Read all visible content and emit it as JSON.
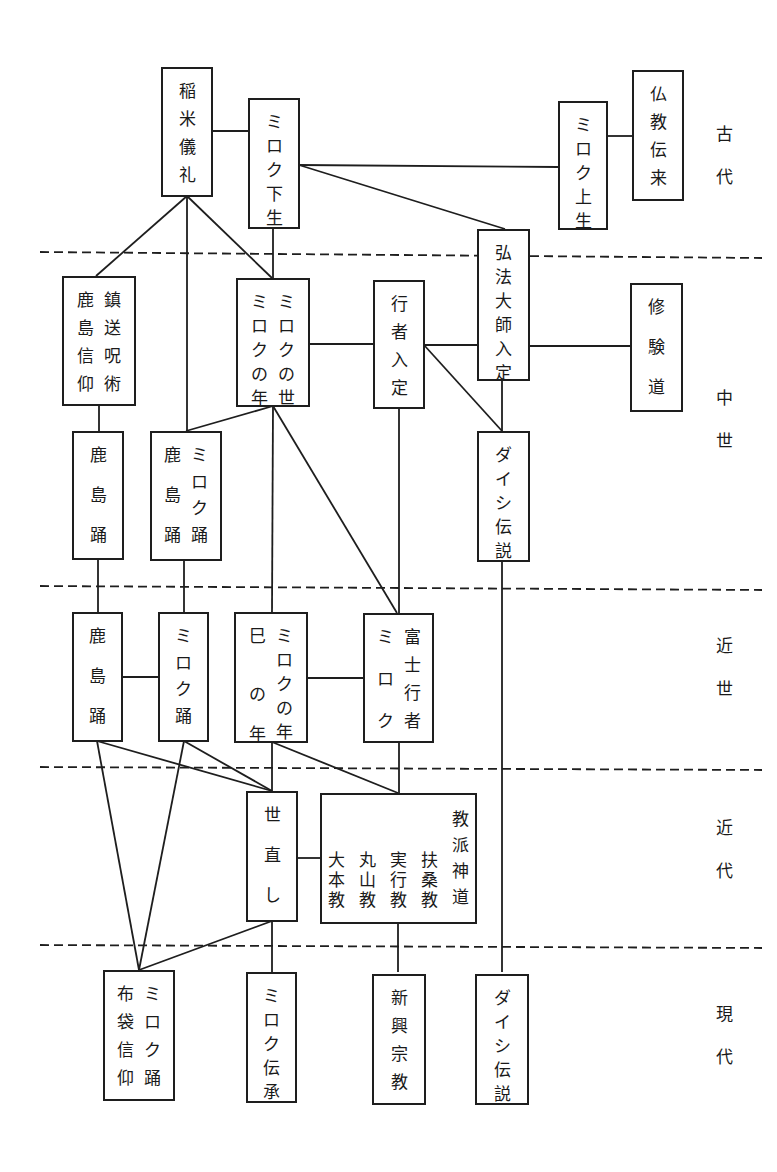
{
  "diagram": {
    "type": "genealogy-flowchart",
    "orientation": "vertical-japanese-text",
    "eras": [
      {
        "id": "kodai",
        "label": "古代",
        "chars": [
          "古",
          "代"
        ]
      },
      {
        "id": "chusei",
        "label": "中世",
        "chars": [
          "中",
          "世"
        ]
      },
      {
        "id": "kinsei",
        "label": "近世",
        "chars": [
          "近",
          "世"
        ]
      },
      {
        "id": "kindai",
        "label": "近代",
        "chars": [
          "近",
          "代"
        ]
      },
      {
        "id": "gendai",
        "label": "現代",
        "chars": [
          "現",
          "代"
        ]
      }
    ],
    "nodes": [
      {
        "id": "inamai",
        "era": "kodai",
        "columns": [
          [
            "稲",
            "米",
            "儀",
            "礼"
          ]
        ],
        "label": "稲米儀礼"
      },
      {
        "id": "miroku_gesho",
        "era": "kodai",
        "columns": [
          [
            "ミ",
            "ロ",
            "ク",
            "下",
            "生"
          ]
        ],
        "label": "ミロク下生"
      },
      {
        "id": "miroku_josho",
        "era": "kodai",
        "columns": [
          [
            "ミ",
            "ロ",
            "ク",
            "上",
            "生"
          ]
        ],
        "label": "ミロク上生"
      },
      {
        "id": "bukkyo_denrai",
        "era": "kodai",
        "columns": [
          [
            "仏",
            "教",
            "伝",
            "来"
          ]
        ],
        "label": "仏教伝来"
      },
      {
        "id": "kashima_chinso",
        "era": "chusei",
        "columns": [
          [
            "鎮",
            "送",
            "呪",
            "術"
          ],
          [
            "鹿",
            "島",
            "信",
            "仰"
          ]
        ],
        "label": "鎮送呪術 / 鹿島信仰"
      },
      {
        "id": "miroku_yo_toshi",
        "era": "chusei",
        "columns": [
          [
            "ミ",
            "ロ",
            "ク",
            "の",
            "世"
          ],
          [
            "ミ",
            "ロ",
            "ク",
            "の",
            "年"
          ]
        ],
        "label": "ミロクの世 / ミロクの年"
      },
      {
        "id": "gyoja_nyujo",
        "era": "chusei",
        "columns": [
          [
            "行",
            "者",
            "入",
            "定"
          ]
        ],
        "label": "行者入定"
      },
      {
        "id": "kobo_nyujo",
        "era": "chusei",
        "columns": [
          [
            "弘",
            "法",
            "大",
            "師",
            "入",
            "定"
          ]
        ],
        "label": "弘法大師入定"
      },
      {
        "id": "shugendo",
        "era": "chusei",
        "columns": [
          [
            "修",
            "験",
            "道"
          ]
        ],
        "label": "修験道"
      },
      {
        "id": "kashima_odori_1",
        "era": "chusei",
        "columns": [
          [
            "鹿",
            "島",
            "踊"
          ]
        ],
        "label": "鹿島踊"
      },
      {
        "id": "kashima_miroku_odori",
        "era": "chusei",
        "columns": [
          [
            "ミ",
            "ロ",
            "ク",
            "踊"
          ],
          [
            "鹿",
            "島",
            "踊"
          ]
        ],
        "label": "ミロク踊 / 鹿島踊"
      },
      {
        "id": "daishi_1",
        "era": "chusei",
        "columns": [
          [
            "ダ",
            "イ",
            "シ",
            "伝",
            "説"
          ]
        ],
        "label": "ダイシ伝説"
      },
      {
        "id": "kashima_odori_2",
        "era": "kinsei",
        "columns": [
          [
            "鹿",
            "島",
            "踊"
          ]
        ],
        "label": "鹿島踊"
      },
      {
        "id": "miroku_odori",
        "era": "kinsei",
        "columns": [
          [
            "ミ",
            "ロ",
            "ク",
            "踊"
          ]
        ],
        "label": "ミロク踊"
      },
      {
        "id": "mi_no_toshi",
        "era": "kinsei",
        "columns": [
          [
            "ミ",
            "ロ",
            "ク",
            "の",
            "年"
          ],
          [
            "巳",
            "の",
            "年"
          ]
        ],
        "label": "ミロクの年 / 巳の年"
      },
      {
        "id": "fuji_gyoja",
        "era": "kinsei",
        "columns": [
          [
            "富",
            "士",
            "行",
            "者"
          ],
          [
            "ミ",
            "ロ",
            "ク"
          ]
        ],
        "label": "富士行者 / ミロク"
      },
      {
        "id": "yonaoshi",
        "era": "kindai",
        "columns": [
          [
            "世",
            "直",
            "し"
          ]
        ],
        "label": "世直し"
      },
      {
        "id": "kyoha_shinto",
        "era": "kindai",
        "columns": [
          [
            "教",
            "派",
            "神",
            "道"
          ],
          [
            "扶",
            "桑",
            "教"
          ],
          [
            "実",
            "行",
            "教"
          ],
          [
            "丸",
            "山",
            "教"
          ],
          [
            "大",
            "本",
            "教"
          ]
        ],
        "label": "教派神道 扶桑教 実行教 丸山教 大本教"
      },
      {
        "id": "hotei_miroku_odori",
        "era": "gendai",
        "columns": [
          [
            "ミ",
            "ロ",
            "ク",
            "踊"
          ],
          [
            "布",
            "袋",
            "信",
            "仰"
          ]
        ],
        "label": "ミロク踊 / 布袋信仰"
      },
      {
        "id": "miroku_densho",
        "era": "gendai",
        "columns": [
          [
            "ミ",
            "ロ",
            "ク",
            "伝",
            "承"
          ]
        ],
        "label": "ミロク伝承"
      },
      {
        "id": "shinko_shukyo",
        "era": "gendai",
        "columns": [
          [
            "新",
            "興",
            "宗",
            "教"
          ]
        ],
        "label": "新興宗教"
      },
      {
        "id": "daishi_2",
        "era": "gendai",
        "columns": [
          [
            "ダ",
            "イ",
            "シ",
            "伝",
            "説"
          ]
        ],
        "label": "ダイシ伝説"
      }
    ],
    "edges": [
      [
        "inamai",
        "miroku_gesho"
      ],
      [
        "inamai",
        "kashima_chinso"
      ],
      [
        "inamai",
        "kashima_miroku_odori"
      ],
      [
        "inamai",
        "miroku_yo_toshi"
      ],
      [
        "miroku_gesho",
        "miroku_josho"
      ],
      [
        "miroku_gesho",
        "kobo_nyujo"
      ],
      [
        "miroku_gesho",
        "miroku_yo_toshi"
      ],
      [
        "miroku_josho",
        "bukkyo_denrai"
      ],
      [
        "miroku_yo_toshi",
        "gyoja_nyujo"
      ],
      [
        "gyoja_nyujo",
        "kobo_nyujo"
      ],
      [
        "gyoja_nyujo",
        "daishi_1"
      ],
      [
        "kobo_nyujo",
        "shugendo"
      ],
      [
        "kobo_nyujo",
        "daishi_1"
      ],
      [
        "kashima_chinso",
        "kashima_odori_1"
      ],
      [
        "miroku_yo_toshi",
        "kashima_miroku_odori"
      ],
      [
        "miroku_yo_toshi",
        "mi_no_toshi"
      ],
      [
        "miroku_yo_toshi",
        "fuji_gyoja"
      ],
      [
        "gyoja_nyujo",
        "fuji_gyoja"
      ],
      [
        "kashima_odori_1",
        "kashima_odori_2"
      ],
      [
        "kashima_miroku_odori",
        "miroku_odori"
      ],
      [
        "daishi_1",
        "daishi_2"
      ],
      [
        "kashima_odori_2",
        "miroku_odori"
      ],
      [
        "mi_no_toshi",
        "fuji_gyoja"
      ],
      [
        "kashima_odori_2",
        "yonaoshi"
      ],
      [
        "kashima_odori_2",
        "hotei_miroku_odori"
      ],
      [
        "miroku_odori",
        "yonaoshi"
      ],
      [
        "miroku_odori",
        "hotei_miroku_odori"
      ],
      [
        "mi_no_toshi",
        "yonaoshi"
      ],
      [
        "mi_no_toshi",
        "kyoha_shinto"
      ],
      [
        "fuji_gyoja",
        "kyoha_shinto"
      ],
      [
        "yonaoshi",
        "kyoha_shinto"
      ],
      [
        "yonaoshi",
        "hotei_miroku_odori"
      ],
      [
        "yonaoshi",
        "miroku_densho"
      ],
      [
        "kyoha_shinto",
        "shinko_shukyo"
      ]
    ]
  }
}
